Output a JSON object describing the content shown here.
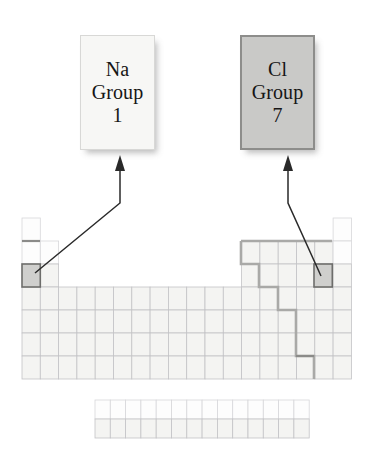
{
  "figure": {
    "background_color": "#ffffff"
  },
  "callouts": [
    {
      "id": "na",
      "symbol": "Na",
      "group_word": "Group",
      "group_number": "1",
      "fill_color": "#f7f7f5",
      "border_color": "#d8d8d6",
      "points_to": "sodium-cell"
    },
    {
      "id": "cl",
      "symbol": "Cl",
      "group_word": "Group",
      "group_number": "7",
      "fill_color": "#c9c9c7",
      "border_color": "#8d8d8b",
      "points_to": "chlorine-cell"
    }
  ],
  "periodic_table": {
    "columns": 18,
    "periods": 7,
    "cell_width": 18.3,
    "cell_height": 23,
    "origin_x": 22,
    "origin_y": 218,
    "grid_line_color": "#c3c3c6",
    "cell_fill_color": "#f4f4f2",
    "highlight_fill_color": "#cfcfcd",
    "highlight_border_color": "#6d6d6b",
    "metalloid_line_color": "#a9a9a7",
    "highlighted_cells": [
      {
        "name": "sodium-cell",
        "group": 1,
        "period": 3
      },
      {
        "name": "chlorine-cell",
        "group": 17,
        "period": 3
      }
    ],
    "inner_transition_block": {
      "rows": 2,
      "columns": 14,
      "origin_x": 95,
      "origin_y": 400,
      "cell_width": 15.3,
      "cell_height": 19
    }
  },
  "arrows": [
    {
      "name": "na-arrow",
      "from": "sodium-cell",
      "to": "callout-na"
    },
    {
      "name": "cl-arrow",
      "from": "chlorine-cell",
      "to": "callout-cl"
    }
  ]
}
